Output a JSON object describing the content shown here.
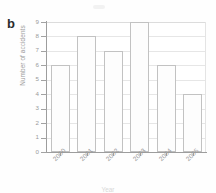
{
  "figure": {
    "panel_label": "b",
    "background_color": "#ffffff",
    "bar_fill_color": "#fdfdfd",
    "bar_edge_color": "#c2c2c2",
    "grid_color": "#e6e6e6",
    "axis_color": "#9d9d9d",
    "text_color": "#9a9a9a"
  },
  "chart_data": {
    "type": "bar",
    "title": "",
    "categories": [
      "2000",
      "2001",
      "2002",
      "2003",
      "2004",
      "2005"
    ],
    "values": [
      6,
      8,
      7,
      9,
      6,
      4
    ],
    "xlabel": "Year",
    "ylabel": "Number of accidents",
    "ylim": [
      0,
      9
    ],
    "yticks": [
      0,
      1,
      2,
      3,
      4,
      5,
      6,
      7,
      8,
      9
    ],
    "ytick_labels": [
      "0",
      "1",
      "2",
      "3",
      "4",
      "5",
      "6",
      "7",
      "8",
      "9"
    ],
    "grid": "horizontal",
    "legend": "none",
    "xtick_label_rotation": "-45"
  }
}
